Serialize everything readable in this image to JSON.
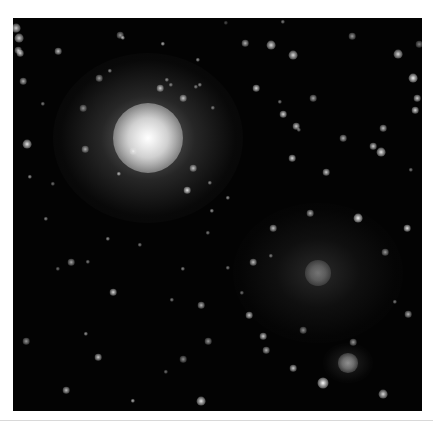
{
  "image": {
    "subject": "deep-sky astronomical image with two galaxies and field stars",
    "background_color": "#030303",
    "frame_color": "#ffffff"
  },
  "galaxies": [
    {
      "name": "bright-galaxy",
      "cx": 135,
      "cy": 120,
      "rx": 95,
      "ry": 85,
      "core_r": 22,
      "intensity": 1.0
    },
    {
      "name": "faint-galaxy",
      "cx": 305,
      "cy": 255,
      "rx": 85,
      "ry": 70,
      "core_r": 8,
      "intensity": 0.35
    },
    {
      "name": "small-galaxy",
      "cx": 335,
      "cy": 345,
      "rx": 25,
      "ry": 20,
      "core_r": 6,
      "intensity": 0.45
    }
  ],
  "stars": [
    [
      107,
      17,
      3,
      0.6
    ],
    [
      232,
      25,
      3,
      0.7
    ],
    [
      339,
      18,
      3,
      0.6
    ],
    [
      385,
      36,
      4,
      0.85
    ],
    [
      406,
      26,
      3,
      0.5
    ],
    [
      270,
      4,
      2,
      0.5
    ],
    [
      213,
      5,
      2,
      0.3
    ],
    [
      7,
      35,
      3,
      0.8
    ],
    [
      45,
      33,
      3,
      0.75
    ],
    [
      110,
      20,
      2,
      0.7
    ],
    [
      150,
      26,
      2,
      0.7
    ],
    [
      86,
      60,
      3,
      0.6
    ],
    [
      154,
      62,
      2,
      0.55
    ],
    [
      147,
      70,
      3,
      0.8
    ],
    [
      187,
      67,
      2,
      0.55
    ],
    [
      243,
      70,
      3,
      0.85
    ],
    [
      258,
      27,
      4,
      0.85
    ],
    [
      280,
      37,
      4,
      0.85
    ],
    [
      400,
      60,
      4,
      0.95
    ],
    [
      404,
      80,
      3,
      0.8
    ],
    [
      402,
      92,
      3,
      0.85
    ],
    [
      267,
      84,
      2,
      0.5
    ],
    [
      300,
      80,
      3,
      0.65
    ],
    [
      270,
      96,
      3,
      0.85
    ],
    [
      283,
      108,
      3,
      0.8
    ],
    [
      286,
      112,
      2,
      0.5
    ],
    [
      360,
      128,
      3,
      0.8
    ],
    [
      368,
      134,
      4,
      0.9
    ],
    [
      279,
      140,
      3,
      0.85
    ],
    [
      313,
      154,
      3,
      0.8
    ],
    [
      398,
      152,
      2,
      0.5
    ],
    [
      3,
      10,
      4,
      0.8
    ],
    [
      6,
      20,
      4,
      0.8
    ],
    [
      5,
      32,
      3,
      0.7
    ],
    [
      120,
      133,
      3,
      0.6
    ],
    [
      106,
      156,
      2,
      0.7
    ],
    [
      174,
      172,
      3,
      0.9
    ],
    [
      199,
      193,
      2,
      0.6
    ],
    [
      158,
      67,
      2,
      0.5
    ],
    [
      10,
      63,
      3,
      0.7
    ],
    [
      30,
      86,
      2,
      0.5
    ],
    [
      14,
      126,
      4,
      0.9
    ],
    [
      70,
      90,
      3,
      0.55
    ],
    [
      17,
      159,
      2,
      0.6
    ],
    [
      40,
      166,
      2,
      0.45
    ],
    [
      72,
      131,
      3,
      0.65
    ],
    [
      97,
      53,
      2,
      0.55
    ],
    [
      170,
      80,
      3,
      0.75
    ],
    [
      200,
      90,
      2,
      0.5
    ],
    [
      183,
      69,
      2,
      0.5
    ],
    [
      185,
      42,
      2,
      0.6
    ],
    [
      330,
      120,
      3,
      0.7
    ],
    [
      370,
      110,
      3,
      0.75
    ],
    [
      100,
      274,
      3,
      0.85
    ],
    [
      159,
      282,
      2,
      0.5
    ],
    [
      188,
      287,
      3,
      0.7
    ],
    [
      236,
      297,
      3,
      0.8
    ],
    [
      250,
      318,
      3,
      0.8
    ],
    [
      13,
      323,
      3,
      0.6
    ],
    [
      73,
      316,
      2,
      0.6
    ],
    [
      85,
      339,
      3,
      0.8
    ],
    [
      53,
      372,
      3,
      0.75
    ],
    [
      120,
      383,
      2,
      0.7
    ],
    [
      188,
      383,
      4,
      0.9
    ],
    [
      153,
      354,
      2,
      0.45
    ],
    [
      170,
      341,
      3,
      0.55
    ],
    [
      195,
      323,
      3,
      0.6
    ],
    [
      253,
      332,
      3,
      0.7
    ],
    [
      280,
      350,
      3,
      0.8
    ],
    [
      310,
      365,
      5,
      1.0
    ],
    [
      370,
      376,
      4,
      0.85
    ],
    [
      340,
      324,
      3,
      0.6
    ],
    [
      290,
      312,
      3,
      0.55
    ],
    [
      395,
      296,
      3,
      0.7
    ],
    [
      382,
      284,
      2,
      0.5
    ],
    [
      394,
      210,
      3,
      0.9
    ],
    [
      372,
      234,
      3,
      0.6
    ],
    [
      260,
      210,
      3,
      0.75
    ],
    [
      240,
      244,
      3,
      0.75
    ],
    [
      229,
      275,
      2,
      0.45
    ],
    [
      345,
      200,
      4,
      0.95
    ],
    [
      297,
      195,
      3,
      0.7
    ],
    [
      258,
      238,
      2,
      0.5
    ],
    [
      95,
      221,
      2,
      0.6
    ],
    [
      75,
      244,
      2,
      0.5
    ],
    [
      45,
      251,
      2,
      0.45
    ],
    [
      33,
      201,
      2,
      0.55
    ],
    [
      58,
      244,
      3,
      0.65
    ],
    [
      127,
      227,
      2,
      0.5
    ],
    [
      197,
      165,
      2,
      0.55
    ],
    [
      180,
      150,
      3,
      0.75
    ],
    [
      215,
      180,
      2,
      0.6
    ],
    [
      195,
      215,
      2,
      0.5
    ],
    [
      170,
      251,
      2,
      0.55
    ],
    [
      215,
      250,
      2,
      0.5
    ]
  ]
}
